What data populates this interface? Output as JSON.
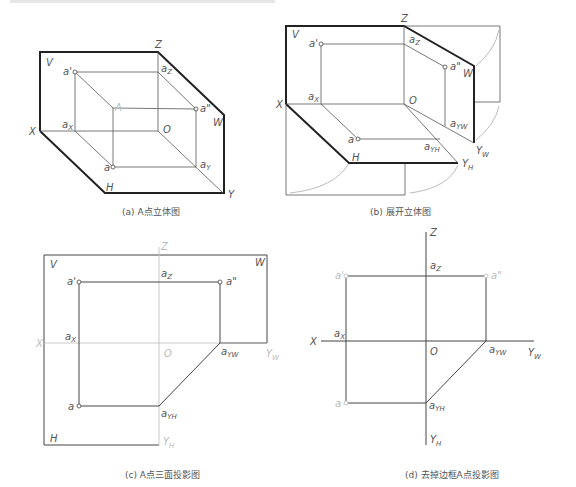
{
  "figures": {
    "a": {
      "caption": "(a) A点立体图",
      "labels": {
        "V": "V",
        "Z": "Z",
        "W": "W",
        "X": "X",
        "H": "H",
        "Y": "Y",
        "O": "O",
        "A": "A",
        "a_prime": "a'",
        "a_dprime": "a\"",
        "a": "a",
        "ax": "a",
        "ax_sub": "X",
        "az": "a",
        "az_sub": "Z",
        "ay": "a",
        "ay_sub": "Y"
      }
    },
    "b": {
      "caption": "(b) 展开立体图",
      "labels": {
        "V": "V",
        "Z": "Z",
        "W": "W",
        "X": "X",
        "H": "H",
        "O": "O",
        "YW": "Y",
        "YW_sub": "W",
        "YH": "Y",
        "YH_sub": "H",
        "a_prime": "a'",
        "a_dprime": "a\"",
        "a": "a",
        "ax": "a",
        "ax_sub": "X",
        "az": "a",
        "az_sub": "Z",
        "ayw": "a",
        "ayw_sub": "YW",
        "ayh": "a",
        "ayh_sub": "YH"
      }
    },
    "c": {
      "caption": "(c) A点三面投影图",
      "labels": {
        "V": "V",
        "Z": "Z",
        "W": "W",
        "X": "X",
        "H": "H",
        "O": "O",
        "YW": "Y",
        "YW_sub": "W",
        "YH": "Y",
        "YH_sub": "H",
        "a_prime": "a'",
        "a_dprime": "a\"",
        "a": "a",
        "ax": "a",
        "ax_sub": "X",
        "az": "a",
        "az_sub": "Z",
        "ayw": "a",
        "ayw_sub": "YW",
        "ayh": "a",
        "ayh_sub": "YH"
      }
    },
    "d": {
      "caption": "(d) 去掉边框A点投影图",
      "labels": {
        "Z": "Z",
        "X": "X",
        "O": "O",
        "YW": "Y",
        "YW_sub": "W",
        "YH": "Y",
        "YH_sub": "H",
        "a_prime": "a'",
        "a_dprime": "a\"",
        "a": "a",
        "ax": "a",
        "ax_sub": "X",
        "az": "a",
        "az_sub": "Z",
        "ayw": "a",
        "ayw_sub": "YW",
        "ayh": "a",
        "ayh_sub": "YH"
      }
    }
  }
}
